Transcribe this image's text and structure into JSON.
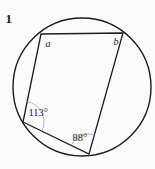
{
  "problem": {
    "number": "1"
  },
  "diagram": {
    "labels": {
      "vertex_a": "a",
      "vertex_b": "b",
      "angle_left": "113°",
      "angle_bottom": "88°"
    },
    "colors": {
      "line": "#1c1c1c",
      "angle_arc": "#aeaeae",
      "background": "#fbfbfb"
    }
  }
}
